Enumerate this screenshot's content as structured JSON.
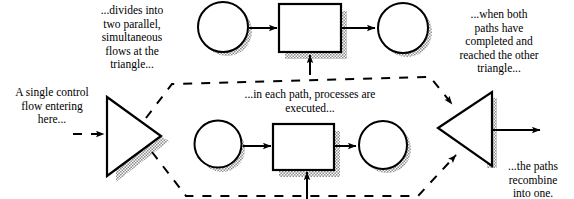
{
  "diagram": {
    "type": "activity-flow",
    "background_color": "#ffffff",
    "stroke_color": "#000000",
    "shadow_color": "#9a9a9a",
    "captions": {
      "entering": "A single control\nflow entering\nhere...",
      "divides": "...divides into\ntwo parallel,\nsimultaneous\nflows at the\ntriangle...",
      "each_path": "...in each path, processes are\nexecuted...",
      "when_both": "...when both\npaths have\ncompleted and\nreached the other\ntriangle...",
      "recombine": "...the paths\nrecombine\ninto one."
    },
    "nodes": [
      {
        "id": "fork-triangle",
        "shape": "triangle-right",
        "row": "middle-left"
      },
      {
        "id": "top-circle-start",
        "shape": "circle",
        "row": "top"
      },
      {
        "id": "top-rectangle",
        "shape": "rectangle",
        "row": "top"
      },
      {
        "id": "top-circle-end",
        "shape": "circle",
        "row": "top"
      },
      {
        "id": "bottom-circle-start",
        "shape": "circle",
        "row": "bottom"
      },
      {
        "id": "bottom-rectangle",
        "shape": "rectangle",
        "row": "bottom"
      },
      {
        "id": "bottom-circle-end",
        "shape": "circle",
        "row": "bottom"
      },
      {
        "id": "join-triangle",
        "shape": "triangle-left",
        "row": "middle-right"
      }
    ],
    "edges": [
      {
        "from": "external-in",
        "to": "fork-triangle",
        "style": "dashed"
      },
      {
        "from": "fork-triangle",
        "to": "top-path",
        "style": "dashed"
      },
      {
        "from": "fork-triangle",
        "to": "bottom-path",
        "style": "dashed"
      },
      {
        "from": "top-circle-start",
        "to": "top-rectangle",
        "style": "solid"
      },
      {
        "from": "top-rectangle",
        "to": "top-circle-end",
        "style": "solid"
      },
      {
        "from": "below",
        "to": "top-rectangle",
        "style": "solid"
      },
      {
        "from": "bottom-circle-start",
        "to": "bottom-rectangle",
        "style": "solid"
      },
      {
        "from": "bottom-rectangle",
        "to": "bottom-circle-end",
        "style": "solid"
      },
      {
        "from": "below",
        "to": "bottom-rectangle",
        "style": "solid"
      },
      {
        "from": "top-path",
        "to": "join-triangle",
        "style": "dashed"
      },
      {
        "from": "bottom-path",
        "to": "join-triangle",
        "style": "dashed"
      },
      {
        "from": "join-triangle",
        "to": "external-out",
        "style": "solid"
      }
    ]
  }
}
